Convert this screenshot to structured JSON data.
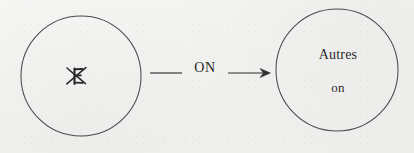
{
  "figure": {
    "type": "node-edge-diagram",
    "background_color": "#f2f2f0",
    "ink_color": "#3a3a3a"
  },
  "nodes": [
    {
      "id": "source-node",
      "shape": "circle",
      "center_x": 81,
      "center_y": 76,
      "radius": 60,
      "label": "",
      "mark": "struck-out-letter",
      "mark_description": "handwritten letter crossed out with an X"
    },
    {
      "id": "target-node",
      "shape": "circle",
      "center_x": 337,
      "center_y": 70,
      "radius": 61,
      "label_primary": "Autres",
      "label_secondary": "on"
    }
  ],
  "edge": {
    "id": "transition-arrow",
    "label": "ON",
    "from": "source-node",
    "to": "target-node",
    "start_x": 150,
    "end_x": 270,
    "y": 73,
    "arrowhead": "open-v"
  }
}
